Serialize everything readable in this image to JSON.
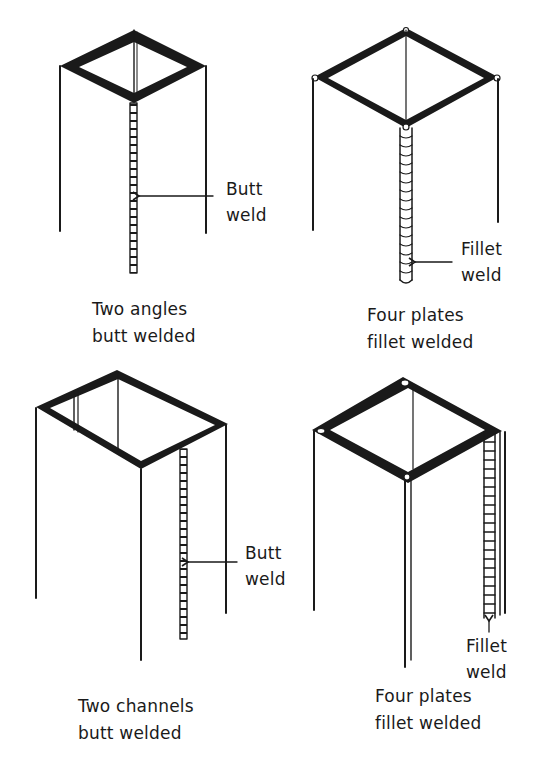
{
  "figure": {
    "panels": [
      {
        "id": "two-angles",
        "caption_line1": "Two angles",
        "caption_line2": "butt welded",
        "callout_line1": "Butt",
        "callout_line2": "weld",
        "weld_type": "butt"
      },
      {
        "id": "four-plates-a",
        "caption_line1": "Four plates",
        "caption_line2": "fillet welded",
        "callout_line1": "Fillet",
        "callout_line2": "weld",
        "weld_type": "fillet"
      },
      {
        "id": "two-channels",
        "caption_line1": "Two channels",
        "caption_line2": "butt welded",
        "callout_line1": "Butt",
        "callout_line2": "weld",
        "weld_type": "butt"
      },
      {
        "id": "four-plates-b",
        "caption_line1": "Four plates",
        "caption_line2": "fillet welded",
        "callout_line1": "Fillet",
        "callout_line2": "weld",
        "weld_type": "fillet"
      }
    ],
    "colors": {
      "ink": "#1a1a1a",
      "background": "#ffffff"
    }
  }
}
